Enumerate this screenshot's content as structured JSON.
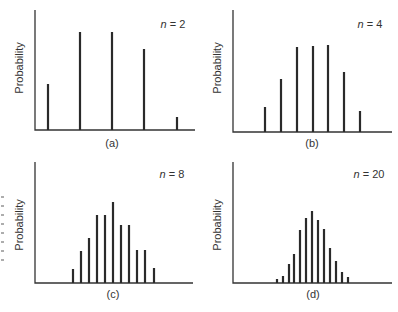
{
  "figure": {
    "y_axis_label": "Probability",
    "edge_artifact_marks": [
      197,
      206,
      215,
      224,
      233,
      242,
      251,
      260
    ]
  },
  "chart_data": [
    {
      "type": "bar",
      "panel_label": "(a)",
      "annotation": "n = 2",
      "n": 2,
      "ylabel": "Probability",
      "xlabel": "",
      "grid": false,
      "bar_count": 5,
      "values": [
        0.47,
        1.0,
        1.0,
        0.83,
        0.13
      ],
      "layout": {
        "axis_x": 35,
        "axis_top": 10,
        "axis_y": 130,
        "axis_right": 195,
        "bar_x": [
          48,
          80,
          112,
          144,
          177
        ],
        "bar_top": [
          84,
          32,
          32,
          49,
          117
        ],
        "ylabel_x": 23,
        "ylabel_y": 68,
        "nlabel_x": 173,
        "nlabel_y": 28,
        "plabel_x": 112,
        "plabel_y": 147
      }
    },
    {
      "type": "bar",
      "panel_label": "(b)",
      "annotation": "n = 4",
      "n": 4,
      "ylabel": "Probability",
      "xlabel": "",
      "grid": false,
      "bar_count": 7,
      "values": [
        0.29,
        0.61,
        0.98,
        0.99,
        1.0,
        0.69,
        0.24
      ],
      "layout": {
        "axis_x": 233,
        "axis_top": 10,
        "axis_y": 132,
        "axis_right": 392,
        "bar_x": [
          265,
          281,
          297,
          313,
          328,
          344,
          360
        ],
        "bar_top": [
          107,
          79,
          47,
          46,
          45,
          72,
          111
        ],
        "ylabel_x": 221,
        "ylabel_y": 68,
        "nlabel_x": 370,
        "nlabel_y": 28,
        "plabel_x": 312,
        "plabel_y": 147
      }
    },
    {
      "type": "bar",
      "panel_label": "(c)",
      "annotation": "n = 8",
      "n": 8,
      "ylabel": "Probability",
      "xlabel": "",
      "grid": false,
      "bar_count": 11,
      "values": [
        0.17,
        0.4,
        0.55,
        0.84,
        0.84,
        1.0,
        0.72,
        0.72,
        0.41,
        0.41,
        0.19
      ],
      "layout": {
        "axis_x": 35,
        "axis_top": 162,
        "axis_y": 283,
        "axis_right": 193,
        "bar_x": [
          73,
          81,
          89,
          97,
          105,
          113,
          121,
          129,
          137,
          145,
          154
        ],
        "bar_top": [
          269,
          251,
          238,
          215,
          215,
          202,
          225,
          225,
          250,
          250,
          268
        ],
        "ylabel_x": 23,
        "ylabel_y": 225,
        "nlabel_x": 172,
        "nlabel_y": 178,
        "plabel_x": 113,
        "plabel_y": 298
      }
    },
    {
      "type": "bar",
      "panel_label": "(d)",
      "annotation": "n = 20",
      "n": 20,
      "ylabel": "Probability",
      "xlabel": "",
      "grid": false,
      "bar_count": 13,
      "values": [
        0.06,
        0.1,
        0.26,
        0.4,
        0.74,
        0.9,
        1.0,
        0.88,
        0.75,
        0.49,
        0.31,
        0.15,
        0.08
      ],
      "layout": {
        "axis_x": 233,
        "axis_top": 162,
        "axis_y": 283,
        "axis_right": 392,
        "bar_x": [
          277,
          283,
          289,
          294,
          300,
          306,
          312,
          318,
          324,
          330,
          336,
          342,
          348
        ],
        "bar_top": [
          279,
          276,
          264,
          254,
          230,
          218,
          211,
          220,
          229,
          248,
          261,
          272,
          277
        ],
        "ylabel_x": 221,
        "ylabel_y": 225,
        "nlabel_x": 369,
        "nlabel_y": 178,
        "plabel_x": 313,
        "plabel_y": 298
      }
    }
  ]
}
